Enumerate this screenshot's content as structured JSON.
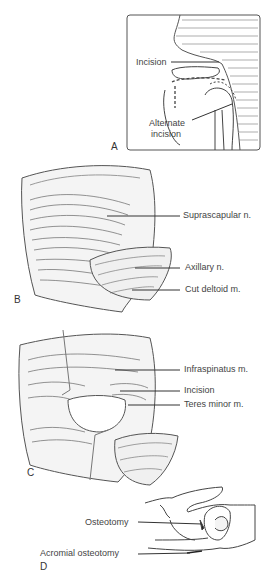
{
  "figure": {
    "panels": [
      {
        "id": "A",
        "letter": "A",
        "labels": {
          "incision": "Incision",
          "alternate_1": "Alternate",
          "alternate_2": "incision"
        }
      },
      {
        "id": "B",
        "letter": "B",
        "labels": {
          "suprascapular": "Suprascapular n.",
          "axillary": "Axillary n.",
          "cut_deltoid": "Cut deltoid m."
        }
      },
      {
        "id": "C",
        "letter": "C",
        "labels": {
          "infraspinatus": "Infraspinatus m.",
          "incision": "Incision",
          "teres_minor": "Teres minor m."
        }
      },
      {
        "id": "D",
        "letter": "D",
        "labels": {
          "osteotomy": "Osteotomy",
          "acromial_osteotomy": "Acromial osteotomy"
        }
      }
    ]
  }
}
